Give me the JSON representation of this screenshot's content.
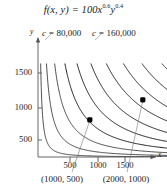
{
  "figure": {
    "title_prefix": "f(x, y) = 100x",
    "title_exp1": "0.6",
    "title_var2": "y",
    "title_exp2": "0.4",
    "axis_x_label": "x",
    "axis_y_label": "y"
  },
  "contour_labels": [
    {
      "prefix": "c = ",
      "value": "80,000"
    },
    {
      "prefix": "c = ",
      "value": "160,000"
    }
  ],
  "ticks": {
    "y": [
      "1500",
      "1000",
      "500"
    ],
    "x": [
      "500",
      "1000",
      "1500"
    ]
  },
  "points": [
    {
      "label": "(1000, 500)"
    },
    {
      "label": "(2000, 1000)"
    }
  ],
  "chart_data": {
    "type": "line",
    "subtype": "contour",
    "function": "f(x,y) = 100*x^0.6*y^0.4",
    "xlabel": "x",
    "ylabel": "y",
    "xlim": [
      0,
      2200
    ],
    "ylim": [
      0,
      1900
    ],
    "xticks": [
      500,
      1000,
      1500
    ],
    "yticks": [
      500,
      1000,
      1500
    ],
    "grid": false,
    "legend": "none",
    "contour_levels": [
      20000,
      40000,
      60000,
      80000,
      100000,
      120000,
      140000,
      160000,
      180000,
      200000,
      220000,
      240000,
      260000,
      280000,
      300000,
      320000,
      340000,
      360000
    ],
    "annotations": [
      {
        "text": "c = 80,000",
        "points_to_level": 80000
      },
      {
        "text": "c = 160,000",
        "points_to_level": 160000
      }
    ],
    "marked_points": [
      {
        "x": 1000,
        "y": 500,
        "label": "(1000, 500)",
        "value": 80000
      },
      {
        "x": 2000,
        "y": 1000,
        "label": "(2000, 1000)",
        "value": 160000
      }
    ],
    "colors": {
      "curve": "#111111",
      "axis": "#555555",
      "point": "#000000"
    }
  }
}
